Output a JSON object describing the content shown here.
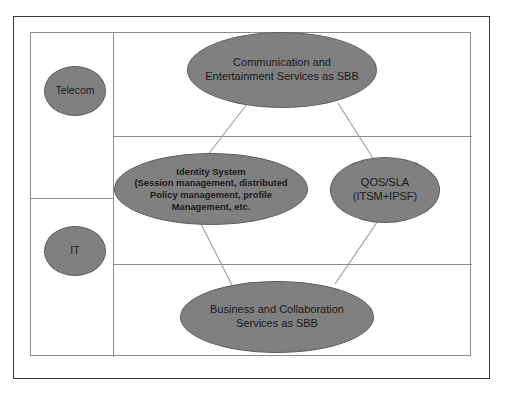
{
  "diagram": {
    "colors": {
      "node_fill": "#808080",
      "node_stroke": "#5e5e5e",
      "grid_stroke": "#8b8b8b",
      "frame_stroke": "#3a3a3a",
      "connector_stroke": "#9a9a9a",
      "text": "#1b1b1b",
      "background": "#ffffff"
    },
    "columns": [
      {
        "name": "domain-label-column",
        "label": "Domain labels"
      },
      {
        "name": "content-column",
        "label": "Service building blocks"
      }
    ],
    "domain_labels": [
      {
        "id": "telecom",
        "label": "Telecom"
      },
      {
        "id": "it",
        "label": "IT"
      }
    ],
    "nodes": [
      {
        "id": "communication",
        "label": "Communication and\nEntertainment Services as SBB",
        "row": "top",
        "shape": "ellipse"
      },
      {
        "id": "identity-system",
        "label": "Identity System\n(Session management, distributed\nPolicy management, profile\nManagement, etc.",
        "row": "middle",
        "shape": "ellipse"
      },
      {
        "id": "qos-sla",
        "label": "QOS/SLA\n(ITSM+IPSF)",
        "row": "middle",
        "shape": "ellipse"
      },
      {
        "id": "business",
        "label": "Business and Collaboration\nServices as SBB",
        "row": "bottom",
        "shape": "ellipse"
      }
    ],
    "connectors": [
      {
        "from": "communication",
        "to": "identity-system"
      },
      {
        "from": "communication",
        "to": "qos-sla"
      },
      {
        "from": "identity-system",
        "to": "business"
      },
      {
        "from": "qos-sla",
        "to": "business"
      }
    ]
  }
}
